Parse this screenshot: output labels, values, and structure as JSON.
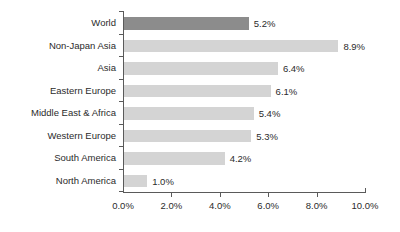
{
  "chart_data": {
    "type": "bar",
    "orientation": "horizontal",
    "title": "",
    "subtitle": "",
    "xlabel": "",
    "ylabel": "",
    "categories": [
      "World",
      "Non-Japan Asia",
      "Asia",
      "Eastern Europe",
      "Middle East & Africa",
      "Western Europe",
      "South America",
      "North America"
    ],
    "values": [
      5.2,
      8.9,
      6.4,
      6.1,
      5.4,
      5.3,
      4.2,
      1.0
    ],
    "value_labels": [
      "5.2%",
      "8.9%",
      "6.4%",
      "6.1%",
      "5.4%",
      "5.3%",
      "4.2%",
      "1.0%"
    ],
    "bar_colors": [
      "#8c8c8c",
      "#d4d4d4",
      "#d4d4d4",
      "#d4d4d4",
      "#d4d4d4",
      "#d4d4d4",
      "#d4d4d4",
      "#d4d4d4"
    ],
    "highlighted_category": "World",
    "xlim": [
      0,
      10
    ],
    "xticks": [
      0,
      2,
      4,
      6,
      8,
      10
    ],
    "xtick_labels": [
      "0.0%",
      "2.0%",
      "4.0%",
      "6.0%",
      "8.0%",
      "10.0%"
    ],
    "grid": false,
    "legend": false,
    "axis_color": "#5a5a5a",
    "text_color": "#2b2b2b",
    "background": "#ffffff"
  }
}
